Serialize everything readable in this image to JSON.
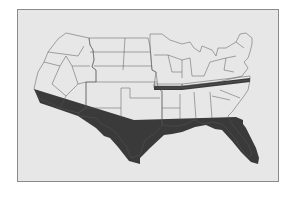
{
  "figure": {
    "type": "3d-extruded-region-map",
    "text_labels": []
  },
  "colors": {
    "frame_background": "#e7e7e7",
    "frame_border": "#8a8a8a",
    "extrusion_shadow": "#3a3a3a",
    "state_outline": "#555555",
    "regions": {
      "west": "#9c9c9c",
      "central": "#7f7f7f",
      "midwest_northeast": "#aeaeae",
      "south": "#8e8e8e",
      "kentucky_tennessee_band": "#6a6a6a"
    }
  },
  "regions": [
    {
      "id": "west",
      "name": "West"
    },
    {
      "id": "central",
      "name": "Central / Plains"
    },
    {
      "id": "midwest_northeast",
      "name": "Midwest & Northeast"
    },
    {
      "id": "south",
      "name": "South"
    }
  ]
}
